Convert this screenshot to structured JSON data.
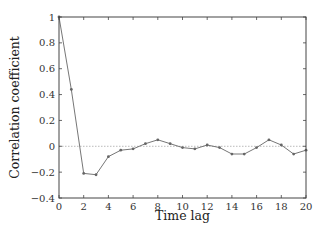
{
  "chart_data": {
    "type": "line",
    "title": "",
    "xlabel": "Time lag",
    "ylabel": "Correlation coefficient",
    "xlim": [
      0,
      20
    ],
    "ylim": [
      -0.4,
      1
    ],
    "x_ticks": [
      0,
      2,
      4,
      6,
      8,
      10,
      12,
      14,
      16,
      18,
      20
    ],
    "x_tick_labels": [
      "0",
      "2",
      "4",
      "6",
      "8",
      "10",
      "12",
      "14",
      "16",
      "18",
      "20"
    ],
    "y_ticks": [
      -0.4,
      -0.2,
      0,
      0.2,
      0.4,
      0.6,
      0.8,
      1
    ],
    "y_tick_labels": [
      "−0.4",
      "−0.2",
      "0",
      "0.2",
      "0.4",
      "0.6",
      "0.8",
      "1"
    ],
    "grid": false,
    "reference_line": {
      "y": 0,
      "style": "dotted",
      "color": "#aaaaaa"
    },
    "legend": null,
    "series": [
      {
        "name": "autocorrelation",
        "color": "#666666",
        "marker": "dot",
        "x": [
          0,
          1,
          2,
          3,
          4,
          5,
          6,
          7,
          8,
          9,
          10,
          11,
          12,
          13,
          14,
          15,
          16,
          17,
          18,
          19,
          20
        ],
        "values": [
          1.0,
          0.44,
          -0.21,
          -0.22,
          -0.08,
          -0.03,
          -0.02,
          0.02,
          0.05,
          0.02,
          -0.01,
          -0.02,
          0.01,
          -0.01,
          -0.06,
          -0.06,
          -0.01,
          0.05,
          0.01,
          -0.06,
          -0.03
        ]
      }
    ]
  }
}
